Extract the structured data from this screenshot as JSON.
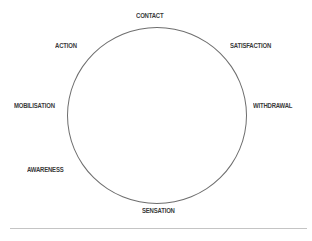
{
  "diagram": {
    "type": "cycle",
    "stages": [
      {
        "label": "CONTACT"
      },
      {
        "label": "SATISFACTION"
      },
      {
        "label": "WITHDRAWAL"
      },
      {
        "label": "SENSATION"
      },
      {
        "label": "AWARENESS"
      },
      {
        "label": "MOBILISATION"
      },
      {
        "label": "ACTION"
      }
    ]
  }
}
